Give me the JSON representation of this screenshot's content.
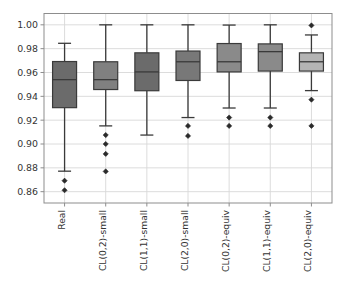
{
  "chart_data": {
    "type": "box",
    "title": "",
    "xlabel": "",
    "ylabel": "",
    "ylim": [
      0.8505,
      1.0095
    ],
    "yticks": [
      0.86,
      0.88,
      0.9,
      0.92,
      0.94,
      0.96,
      0.98,
      1.0
    ],
    "ytick_labels": [
      "0.86",
      "0.88",
      "0.90",
      "0.92",
      "0.94",
      "0.96",
      "0.98",
      "1.00"
    ],
    "grid": true,
    "legend": "none",
    "categories": [
      "Real",
      "CL(0,2)-small",
      "CL(1,1)-small",
      "CL(2,0)-small",
      "CL(0,2)-equiv",
      "CL(1,1)-equiv",
      "CL(2,0)-equiv"
    ],
    "boxes": [
      {
        "label": "Real",
        "whisker_low": 0.8772,
        "q1": 0.9305,
        "median": 0.954,
        "q3": 0.9692,
        "whisker_high": 0.9845,
        "outliers": [
          0.8692,
          0.8612
        ],
        "fill": "#6b6b6b"
      },
      {
        "label": "CL(0,2)-small",
        "whisker_low": 0.9152,
        "q1": 0.9457,
        "median": 0.954,
        "q3": 0.969,
        "whisker_high": 1.0,
        "outliers": [
          0.9075,
          0.9,
          0.8917,
          0.877
        ],
        "fill": "#808080"
      },
      {
        "label": "CL(1,1)-small",
        "whisker_low": 0.9075,
        "q1": 0.9447,
        "median": 0.9605,
        "q3": 0.9765,
        "whisker_high": 1.0,
        "outliers": [],
        "fill": "#6b6b6b"
      },
      {
        "label": "CL(2,0)-small",
        "whisker_low": 0.9222,
        "q1": 0.9533,
        "median": 0.969,
        "q3": 0.978,
        "whisker_high": 1.0,
        "outliers": [
          0.9152,
          0.9068
        ],
        "fill": "#787878"
      },
      {
        "label": "CL(0,2)-equiv",
        "whisker_low": 0.9302,
        "q1": 0.9605,
        "median": 0.969,
        "q3": 0.9843,
        "whisker_high": 0.9998,
        "outliers": [
          0.9222,
          0.9152
        ],
        "fill": "#8a8a8a"
      },
      {
        "label": "CL(1,1)-equiv",
        "whisker_low": 0.9302,
        "q1": 0.9612,
        "median": 0.9775,
        "q3": 0.984,
        "whisker_high": 1.0,
        "outliers": [
          0.9222,
          0.9152
        ],
        "fill": "#8a8a8a"
      },
      {
        "label": "CL(2,0)-equiv",
        "whisker_low": 0.9448,
        "q1": 0.9612,
        "median": 0.969,
        "q3": 0.9765,
        "whisker_high": 0.9915,
        "outliers": [
          0.9995,
          0.9372,
          0.9152
        ],
        "fill": "#b4b4b4"
      }
    ],
    "colors": {
      "box_edge": "#3a3a3a",
      "whisker": "#3a3a3a",
      "median": "#3a3a3a",
      "outlier": "#2a2a2a",
      "grid": "#d8d8d8",
      "frame": "#8d8d8d",
      "background": "#ffffff",
      "tick_text": "#333333"
    }
  }
}
